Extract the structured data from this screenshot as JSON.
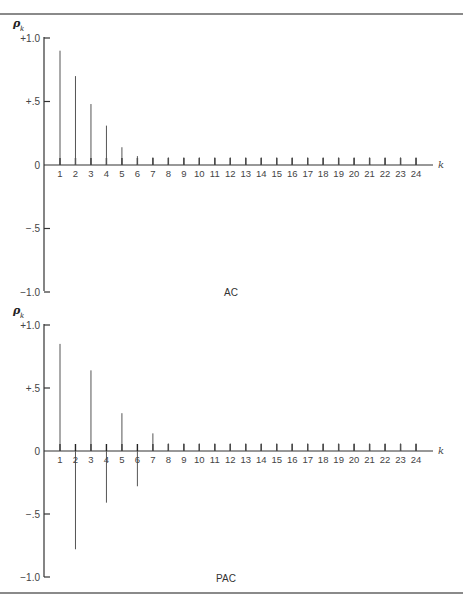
{
  "chart_data": [
    {
      "type": "bar",
      "title": "AC",
      "ylabel": "ρk",
      "xlabel": "k",
      "ylim": [
        -1.0,
        1.0
      ],
      "yticks": [
        "+1.0",
        "+.5",
        "0",
        "−.5",
        "−1.0"
      ],
      "ytick_values": [
        1.0,
        0.5,
        0,
        -0.5,
        -1.0
      ],
      "categories": [
        1,
        2,
        3,
        4,
        5,
        6,
        7,
        8,
        9,
        10,
        11,
        12,
        13,
        14,
        15,
        16,
        17,
        18,
        19,
        20,
        21,
        22,
        23,
        24
      ],
      "values": [
        0.9,
        0.7,
        0.48,
        0.31,
        0.14,
        0.07,
        0.06,
        0.06,
        0.06,
        0.06,
        0.06,
        0.06,
        0.06,
        0.06,
        0.06,
        0.06,
        0.06,
        0.06,
        0.06,
        0.06,
        0.06,
        0.06,
        0.06,
        0.06
      ],
      "grid": false
    },
    {
      "type": "bar",
      "title": "PAC",
      "ylabel": "ρk",
      "xlabel": "k",
      "ylim": [
        -1.0,
        1.0
      ],
      "yticks": [
        "+1.0",
        "+.5",
        "0",
        "−.5",
        "−1.0"
      ],
      "ytick_values": [
        1.0,
        0.5,
        0,
        -0.5,
        -1.0
      ],
      "categories": [
        1,
        2,
        3,
        4,
        5,
        6,
        7,
        8,
        9,
        10,
        11,
        12,
        13,
        14,
        15,
        16,
        17,
        18,
        19,
        20,
        21,
        22,
        23,
        24
      ],
      "values": [
        0.85,
        -0.78,
        0.64,
        -0.41,
        0.3,
        -0.28,
        0.14,
        0.06,
        0.06,
        0.06,
        0.06,
        0.06,
        0.06,
        0.06,
        0.06,
        0.06,
        0.06,
        0.06,
        0.06,
        0.06,
        0.06,
        0.06,
        0.06,
        0.06
      ],
      "grid": false
    }
  ],
  "charts": [
    {
      "title": "AC",
      "y_symbol": "ρ",
      "y_sub": "k",
      "x_symbol": "k"
    },
    {
      "title": "PAC",
      "y_symbol": "ρ",
      "y_sub": "k",
      "x_symbol": "k"
    }
  ],
  "colors": {
    "bar": "#555555",
    "axis": "#333333",
    "rule": "#8a8a8a"
  }
}
